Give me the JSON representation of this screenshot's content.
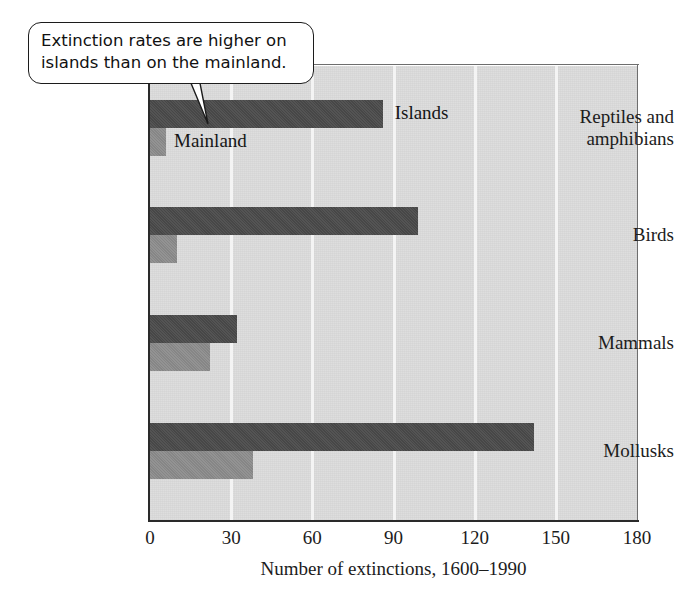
{
  "callout": {
    "text": "Extinction rates are higher on islands than on the mainland.",
    "pointer_icon": "callout-pointer-icon"
  },
  "chart_data": {
    "type": "bar",
    "orientation": "horizontal",
    "title": "",
    "xlabel": "Number of extinctions, 1600–1990",
    "ylabel": "",
    "xlim": [
      0,
      180
    ],
    "xticks": [
      0,
      30,
      60,
      90,
      120,
      150,
      180
    ],
    "xtick_labels": [
      "0",
      "30",
      "60",
      "90",
      "120",
      "150",
      "180"
    ],
    "grid": true,
    "grid_axis": "x",
    "legend": "inline-labels",
    "categories": [
      "Reptiles and amphibians",
      "Birds",
      "Mammals",
      "Mollusks"
    ],
    "series": [
      {
        "name": "Islands",
        "color": "#4b4b4b",
        "values": [
          86,
          99,
          32,
          142
        ]
      },
      {
        "name": "Mainland",
        "color": "#8d8d8d",
        "values": [
          6,
          10,
          22,
          38
        ]
      }
    ],
    "annotations": [
      {
        "text": "Extinction rates are higher on islands than on the mainland.",
        "points_to": "Reptiles and amphibians / Islands bar"
      },
      {
        "text": "Islands",
        "kind": "series-label"
      },
      {
        "text": "Mainland",
        "kind": "series-label"
      }
    ],
    "plot_background": "#dcdcdc",
    "gridline_color": "#f4f4f4"
  },
  "category_labels": [
    {
      "line1": "Reptiles and",
      "line2": "amphibians"
    },
    {
      "line1": "Birds",
      "line2": ""
    },
    {
      "line1": "Mammals",
      "line2": ""
    },
    {
      "line1": "Mollusks",
      "line2": ""
    }
  ],
  "series_labels": {
    "islands": "Islands",
    "mainland": "Mainland"
  },
  "axis": {
    "x_title": "Number of extinctions, 1600–1990",
    "t0": "0",
    "t1": "30",
    "t2": "60",
    "t3": "90",
    "t4": "120",
    "t5": "150",
    "t6": "180"
  }
}
